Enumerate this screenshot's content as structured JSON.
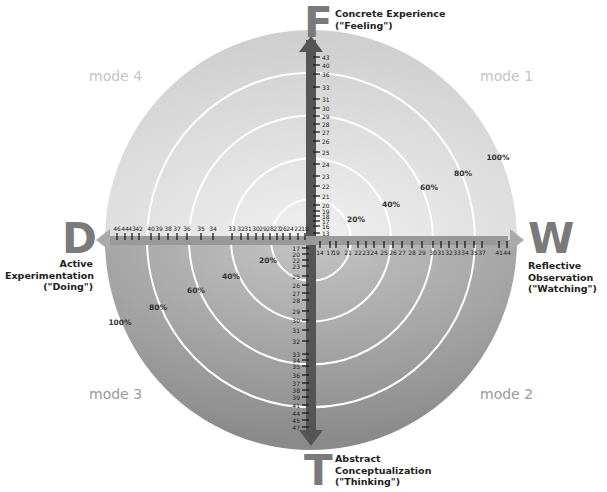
{
  "diagram": {
    "axes": {
      "top": {
        "letter": "F",
        "label_line1": "Concrete Experience",
        "label_line2": "(\"Feeling\")"
      },
      "bottom": {
        "letter": "T",
        "label_line1": "Abstract",
        "label_line2": "Conceptualization",
        "label_line3": "(\"Thinking\")"
      },
      "left": {
        "letter": "D",
        "label_line1": "Active",
        "label_line2": "Experimentation",
        "label_line3": "(\"Doing\")"
      },
      "right": {
        "letter": "W",
        "label_line1": "Reflective",
        "label_line2": "Observation",
        "label_line3": "(\"Watching\")"
      }
    },
    "modes": {
      "mode1": "mode 1",
      "mode2": "mode 2",
      "mode3": "mode 3",
      "mode4": "mode 4"
    },
    "rings": [
      "20%",
      "40%",
      "60%",
      "80%",
      "100%"
    ],
    "scales": {
      "up": [
        "13",
        "16",
        "17",
        "18",
        "19",
        "20",
        "21",
        "22",
        "23",
        "24",
        "25",
        "26",
        "27",
        "28",
        "29",
        "30",
        "31",
        "33",
        "36",
        "40",
        "43"
      ],
      "down": [
        "17",
        "20",
        "22",
        "23",
        "25",
        "26",
        "27",
        "28",
        "29",
        "30",
        "31",
        "32",
        "33",
        "34",
        "35",
        "36",
        "37",
        "38",
        "39",
        "41",
        "44",
        "45",
        "47"
      ],
      "left": [
        "18",
        "22",
        "24",
        "26",
        "27",
        "28",
        "29",
        "30",
        "31",
        "32",
        "33",
        "34",
        "35",
        "36",
        "37",
        "38",
        "39",
        "40",
        "42",
        "43",
        "44",
        "46"
      ],
      "right": [
        "14",
        "17",
        "19",
        "21",
        "22",
        "23",
        "24",
        "25",
        "26",
        "27",
        "28",
        "29",
        "30",
        "31",
        "32",
        "33",
        "34",
        "35",
        "37",
        "41",
        "44"
      ]
    },
    "colors": {
      "upper_fill": "#d9d9d9",
      "lower_fill": "#9a9a9a",
      "axis": "#555555",
      "ring": "#ffffff",
      "letters": "#7a7a7a"
    }
  }
}
